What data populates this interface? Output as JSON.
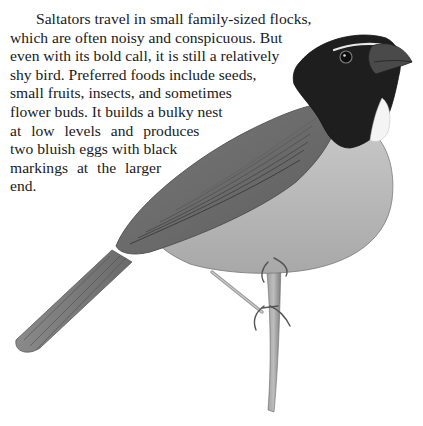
{
  "page": {
    "type": "book-page",
    "paragraph": {
      "lines": [
        "Saltators travel in small family-sized flocks,",
        "which are often noisy and conspicuous. But",
        "even with its bold call, it is still a relatively",
        "shy bird. Preferred foods include seeds,",
        "small fruits, insects, and sometimes",
        "flower buds. It builds a bulky nest",
        "at low levels and produces",
        "two bluish eggs with black",
        "markings at the larger",
        "end."
      ]
    },
    "illustration": {
      "subject": "saltator-bird-perched-on-twig",
      "style": "grayscale pencil illustration",
      "colors": {
        "head": "#1e1e1e",
        "back": "#6f6f6f",
        "wing": "#5a5a5a",
        "belly": "#b9b9b9",
        "throat_patch": "#f4f4f4",
        "brow_stripe": "#e8e8e8",
        "beak": "#4a4a4a",
        "twig": "#8a8a8a"
      }
    }
  }
}
